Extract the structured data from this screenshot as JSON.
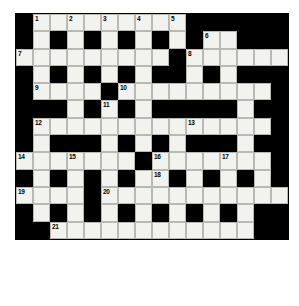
{
  "puzzle": {
    "title": "Crossword Grid",
    "type": "crossword",
    "rows": 16,
    "cols": 16,
    "cell_size": 17,
    "colors": {
      "block": "#000000",
      "open": "#f2f2ef",
      "cell_border": "#b9b9b4",
      "number": "#000000",
      "page_background": "#ffffff"
    },
    "legend": {
      "open_cell": "white-answer-cell",
      "block_cell": "black-block-cell"
    },
    "clue_numbers": [
      1,
      2,
      3,
      4,
      5,
      6,
      7,
      8,
      9,
      10,
      11,
      12,
      13,
      14,
      15,
      16,
      17,
      18,
      19,
      20,
      21
    ],
    "grid": [
      [
        0,
        1,
        1,
        1,
        1,
        1,
        1,
        1,
        1,
        1,
        0,
        0,
        0,
        0,
        0,
        0
      ],
      [
        0,
        1,
        0,
        1,
        0,
        1,
        0,
        1,
        0,
        1,
        0,
        1,
        1,
        0,
        0,
        0
      ],
      [
        1,
        1,
        1,
        1,
        1,
        1,
        1,
        1,
        1,
        0,
        1,
        1,
        1,
        1,
        1,
        1
      ],
      [
        0,
        1,
        0,
        1,
        0,
        1,
        0,
        1,
        0,
        0,
        1,
        0,
        1,
        0,
        0,
        0
      ],
      [
        0,
        1,
        1,
        1,
        1,
        0,
        1,
        1,
        1,
        1,
        1,
        1,
        1,
        1,
        1,
        0
      ],
      [
        0,
        0,
        0,
        1,
        0,
        1,
        0,
        1,
        0,
        0,
        0,
        0,
        0,
        1,
        0,
        0
      ],
      [
        0,
        1,
        1,
        1,
        1,
        1,
        1,
        1,
        1,
        1,
        1,
        1,
        1,
        1,
        1,
        0
      ],
      [
        0,
        1,
        0,
        0,
        0,
        1,
        0,
        1,
        0,
        1,
        0,
        0,
        0,
        1,
        0,
        0
      ],
      [
        1,
        1,
        1,
        1,
        1,
        1,
        1,
        0,
        1,
        1,
        1,
        1,
        1,
        1,
        1,
        0
      ],
      [
        0,
        1,
        0,
        1,
        0,
        1,
        0,
        1,
        1,
        0,
        1,
        0,
        1,
        0,
        1,
        0
      ],
      [
        1,
        1,
        1,
        1,
        0,
        1,
        1,
        1,
        1,
        1,
        1,
        1,
        1,
        1,
        1,
        1
      ],
      [
        0,
        1,
        0,
        1,
        0,
        1,
        0,
        1,
        0,
        1,
        0,
        1,
        0,
        1,
        0,
        0
      ],
      [
        0,
        0,
        1,
        1,
        1,
        1,
        1,
        1,
        1,
        1,
        1,
        1,
        1,
        1,
        0,
        0
      ]
    ],
    "numbered_cells": [
      {
        "row": 0,
        "col": 1,
        "num": 1
      },
      {
        "row": 0,
        "col": 3,
        "num": 2
      },
      {
        "row": 0,
        "col": 5,
        "num": 3
      },
      {
        "row": 0,
        "col": 7,
        "num": 4
      },
      {
        "row": 0,
        "col": 9,
        "num": 5
      },
      {
        "row": 1,
        "col": 11,
        "num": 6
      },
      {
        "row": 2,
        "col": 0,
        "num": 7
      },
      {
        "row": 2,
        "col": 10,
        "num": 8
      },
      {
        "row": 4,
        "col": 1,
        "num": 9
      },
      {
        "row": 4,
        "col": 6,
        "num": 10
      },
      {
        "row": 5,
        "col": 5,
        "num": 11
      },
      {
        "row": 6,
        "col": 1,
        "num": 12
      },
      {
        "row": 6,
        "col": 10,
        "num": 13
      },
      {
        "row": 8,
        "col": 0,
        "num": 14
      },
      {
        "row": 8,
        "col": 3,
        "num": 15
      },
      {
        "row": 8,
        "col": 8,
        "num": 16
      },
      {
        "row": 8,
        "col": 12,
        "num": 17
      },
      {
        "row": 9,
        "col": 8,
        "num": 18
      },
      {
        "row": 10,
        "col": 0,
        "num": 19
      },
      {
        "row": 10,
        "col": 5,
        "num": 20
      },
      {
        "row": 12,
        "col": 2,
        "num": 21
      }
    ]
  }
}
